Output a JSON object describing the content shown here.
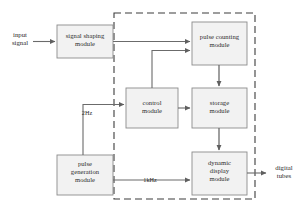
{
  "diagram": {
    "background_color": "#ffffff",
    "box_fill_color": "#f2f2f2",
    "box_stroke_color": "#8c8c8c",
    "line_color": "#6b6b6b",
    "dashed_border_color": "#3c3c3c",
    "text_color": "#2b2b2b",
    "enclosure": {
      "name": "fpga-enclosure",
      "style": "dashed",
      "x": 114,
      "y": 13,
      "width": 141,
      "height": 186
    },
    "blocks": [
      {
        "id": "signal-shaping-module",
        "label": "signal shaping\nmodule",
        "x": 57,
        "y": 25,
        "width": 56,
        "height": 33,
        "inside_enclosure": false
      },
      {
        "id": "pulse-counting-module",
        "label": "pulse counting\nmodule",
        "x": 192,
        "y": 22,
        "width": 55,
        "height": 43,
        "inside_enclosure": true
      },
      {
        "id": "control-module",
        "label": "control\nmodule",
        "x": 126,
        "y": 88,
        "width": 52,
        "height": 40,
        "inside_enclosure": true
      },
      {
        "id": "storage-module",
        "label": "storage\nmodule",
        "x": 192,
        "y": 88,
        "width": 55,
        "height": 40,
        "inside_enclosure": true
      },
      {
        "id": "pulse-generation-module",
        "label": "pulse\ngeneration\nmodule",
        "x": 57,
        "y": 155,
        "width": 56,
        "height": 40,
        "inside_enclosure": false
      },
      {
        "id": "dynamic-display-module",
        "label": "dynamic\ndisplay\nmodule",
        "x": 192,
        "y": 152,
        "width": 55,
        "height": 43,
        "inside_enclosure": true
      }
    ],
    "external_labels": [
      {
        "id": "input-signal-label",
        "label": "input\nsignal",
        "x": 3,
        "y": 30,
        "width": 34
      },
      {
        "id": "digital-tubes-label",
        "label": "digital\ntubes",
        "x": 264,
        "y": 165,
        "width": 40
      }
    ],
    "edge_labels": [
      {
        "id": "freq-2hz-label",
        "label": "2Hz",
        "x": 76,
        "y": 109,
        "width": 22
      },
      {
        "id": "freq-1khz-label",
        "label": "1kHz",
        "x": 138,
        "y": 176,
        "width": 24
      }
    ],
    "connections": [
      {
        "id": "input-to-signal-shaping",
        "from": "input signal",
        "to": "signal shaping module"
      },
      {
        "id": "signal-shaping-to-pulse-counting",
        "from": "signal shaping module",
        "to": "pulse counting module"
      },
      {
        "id": "control-to-pulse-counting",
        "from": "control module",
        "to": "pulse counting module"
      },
      {
        "id": "pulse-counting-to-storage",
        "from": "pulse counting module",
        "to": "storage module"
      },
      {
        "id": "control-to-storage",
        "from": "control module",
        "to": "storage module"
      },
      {
        "id": "storage-to-dynamic-display",
        "from": "storage module",
        "to": "dynamic display module"
      },
      {
        "id": "pulse-generation-to-control-2hz",
        "from": "pulse generation module",
        "to": "control module",
        "label": "2Hz"
      },
      {
        "id": "pulse-generation-to-dynamic-display-1khz",
        "from": "pulse generation module",
        "to": "dynamic display module",
        "label": "1kHz"
      },
      {
        "id": "dynamic-display-to-digital-tubes",
        "from": "dynamic display module",
        "to": "digital tubes"
      }
    ]
  }
}
